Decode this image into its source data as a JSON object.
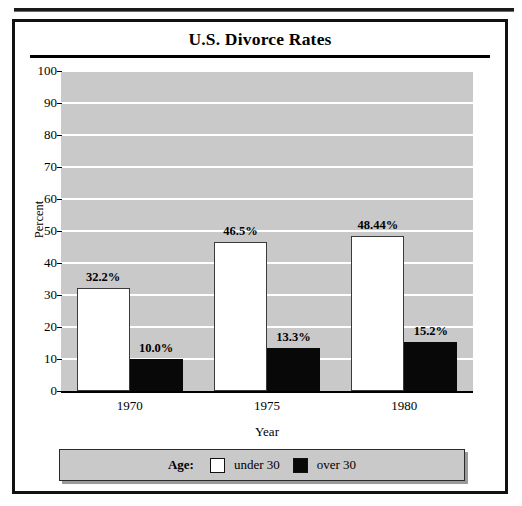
{
  "figure": {
    "title": "U.S. Divorce Rates"
  },
  "chart_data": {
    "type": "bar",
    "title": "U.S. Divorce Rates",
    "xlabel": "Year",
    "ylabel": "Percent",
    "categories": [
      "1970",
      "1975",
      "1980"
    ],
    "ylim": [
      0,
      100
    ],
    "yticks": [
      0,
      10,
      20,
      30,
      40,
      50,
      60,
      70,
      80,
      90,
      100
    ],
    "ytick_labels": [
      "0",
      "10",
      "20",
      "30",
      "40",
      "50",
      "60",
      "70",
      "80",
      "90",
      "100"
    ],
    "grid": true,
    "grid_color": "#ffffff",
    "plot_background": "#c9c9c9",
    "legend_position": "bottom",
    "legend_title": "Age:",
    "series": [
      {
        "name": "under 30",
        "color": "#ffffff",
        "values": [
          32.2,
          46.5,
          48.44
        ],
        "data_labels": [
          "32.2%",
          "46.5%",
          "48.44%"
        ]
      },
      {
        "name": "over 30",
        "color": "#080808",
        "values": [
          10.0,
          13.3,
          15.2
        ],
        "data_labels": [
          "10.0%",
          "13.3%",
          "15.2%"
        ]
      }
    ]
  },
  "legend": {
    "title": "Age:",
    "entries": [
      {
        "label": "under 30",
        "swatch": "white"
      },
      {
        "label": "over 30",
        "swatch": "black"
      }
    ]
  }
}
